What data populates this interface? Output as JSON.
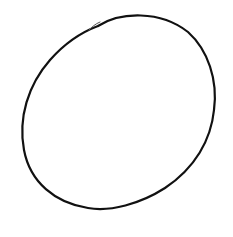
{
  "drawing": {
    "subject": "hand-drawn circle",
    "stroke_color": "#111111",
    "background_color": "#ffffff",
    "stroke_width": 2.2,
    "main_path": "M 98 26 C 120 12, 160 10, 188 32 C 208 50, 218 80, 214 110 C 211 140, 195 168, 165 188 C 140 204, 110 212, 88 208 C 55 203, 30 182, 24 150 C 18 118, 28 85, 50 60 C 65 43, 82 32, 98 26",
    "overlap_path": "M 89 30 C 92 27, 95 24, 100 22"
  }
}
